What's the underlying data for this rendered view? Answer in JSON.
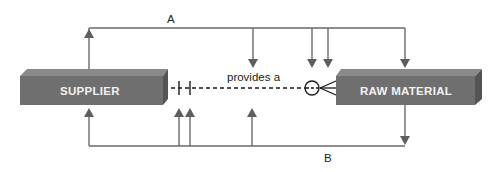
{
  "diagram": {
    "type": "entity-relationship",
    "entities": [
      {
        "id": "supplier",
        "label": "SUPPLIER"
      },
      {
        "id": "raw_material",
        "label": "RAW MATERIAL"
      }
    ],
    "relationship": {
      "label": "provides a",
      "from": "SUPPLIER",
      "to": "RAW MATERIAL",
      "from_cardinality": "one and only one",
      "to_cardinality": "zero or many",
      "line_style": "dashed"
    },
    "loops": [
      {
        "id": "A",
        "label": "A",
        "position": "top"
      },
      {
        "id": "B",
        "label": "B",
        "position": "bottom"
      }
    ]
  },
  "colors": {
    "entity_front": "#6f6f6f",
    "entity_top": "#8a8a8a",
    "entity_side": "#545454",
    "entity_text": "#f2f2f2",
    "line": "#6a6a6a",
    "arrow": "#5e5e5e",
    "relationship_line": "#1a1a1a"
  }
}
